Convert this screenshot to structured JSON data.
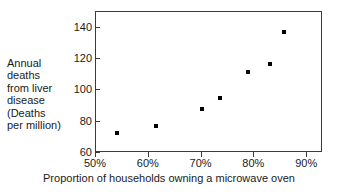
{
  "chart_data": {
    "type": "scatter",
    "title": "",
    "xlabel": "Proportion of households owning a microwave oven",
    "ylabel_lines": [
      "Annual",
      "deaths",
      "from liver",
      "disease",
      "(Deaths",
      "per million)"
    ],
    "ylabel": "Annual deaths from liver disease (Deaths per million)",
    "xlim": [
      50,
      93
    ],
    "ylim": [
      60,
      150
    ],
    "xticks": [
      50,
      60,
      70,
      80,
      90
    ],
    "xticklabels": [
      "50%",
      "60%",
      "70%",
      "80%",
      "90%"
    ],
    "yticks": [
      60,
      80,
      100,
      120,
      140
    ],
    "yticklabels": [
      "60",
      "80",
      "100",
      "120",
      "140"
    ],
    "grid": false,
    "legend": false,
    "marker": "square",
    "marker_color": "#000000",
    "points": [
      {
        "x": 54.0,
        "y": 73
      },
      {
        "x": 61.3,
        "y": 77
      },
      {
        "x": 70.0,
        "y": 88
      },
      {
        "x": 73.4,
        "y": 95
      },
      {
        "x": 78.8,
        "y": 112
      },
      {
        "x": 83.0,
        "y": 117
      },
      {
        "x": 85.6,
        "y": 137
      }
    ]
  }
}
